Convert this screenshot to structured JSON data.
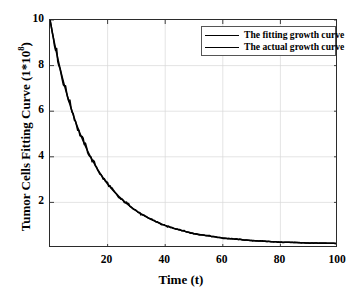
{
  "chart_data": {
    "type": "line",
    "title": "",
    "xlabel": "Time (t)",
    "ylabel_text": "Tumor Cells Fitting Curve (1*10",
    "ylabel_sup": "8",
    "ylabel_tail": ")",
    "ylabel_full": "Tumor Cells Fitting Curve (1*10^8)",
    "xlim": [
      0,
      100
    ],
    "ylim": [
      0,
      10
    ],
    "xticks": [
      20,
      40,
      60,
      80,
      100
    ],
    "yticks": [
      2,
      4,
      6,
      8,
      10
    ],
    "xtick_labels": [
      "20",
      "40",
      "60",
      "80",
      "100"
    ],
    "ytick_labels": [
      "2",
      "4",
      "6",
      "8",
      "10"
    ],
    "grid": true,
    "grid_color": "#d8d8d8",
    "axis_color": "#2b2b2b",
    "legend_position": "top-right",
    "legend": [
      {
        "name": "The fitting growth curve",
        "color": "#000000"
      },
      {
        "name": "The actual growth curve",
        "color": "#000000"
      }
    ],
    "series": [
      {
        "name": "The fitting growth curve",
        "color": "#000000",
        "x": [
          0,
          2,
          4,
          6,
          8,
          10,
          12,
          14,
          16,
          18,
          20,
          24,
          28,
          32,
          36,
          40,
          45,
          50,
          55,
          60,
          65,
          70,
          75,
          80,
          85,
          90,
          95,
          100
        ],
        "y": [
          10.0,
          8.72,
          7.62,
          6.68,
          5.86,
          5.16,
          4.55,
          4.02,
          3.56,
          3.16,
          2.81,
          2.25,
          1.81,
          1.47,
          1.2,
          0.99,
          0.79,
          0.64,
          0.53,
          0.44,
          0.38,
          0.33,
          0.29,
          0.26,
          0.24,
          0.22,
          0.21,
          0.2
        ]
      },
      {
        "name": "The actual growth curve",
        "color": "#000000",
        "x": [
          0,
          2,
          4,
          6,
          8,
          10,
          12,
          14,
          16,
          18,
          20,
          24,
          28,
          32,
          36,
          40,
          45,
          50,
          55,
          60,
          65,
          70,
          75,
          80,
          85,
          90,
          95,
          100
        ],
        "y": [
          10.0,
          8.78,
          7.55,
          6.75,
          5.92,
          5.1,
          4.6,
          3.98,
          3.6,
          3.12,
          2.84,
          2.2,
          1.85,
          1.44,
          1.22,
          0.97,
          0.81,
          0.62,
          0.54,
          0.43,
          0.39,
          0.32,
          0.3,
          0.25,
          0.25,
          0.21,
          0.22,
          0.2
        ]
      }
    ]
  }
}
